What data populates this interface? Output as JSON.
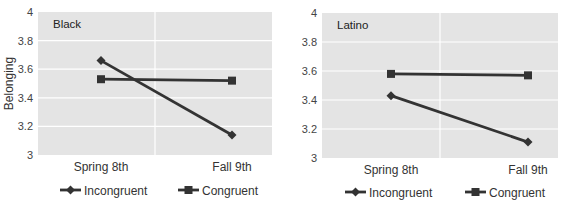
{
  "chart_data": [
    {
      "type": "line",
      "title": "Black",
      "xlabel": "",
      "ylabel": "Belonging",
      "categories": [
        "Spring 8th",
        "Fall 9th"
      ],
      "ylim": [
        3,
        4
      ],
      "yticks": [
        "3",
        "3.2",
        "3.4",
        "3.6",
        "3.8",
        "4"
      ],
      "grid": true,
      "legend_position": "bottom",
      "series": [
        {
          "name": "Incongruent",
          "marker": "diamond",
          "values": [
            3.66,
            3.14
          ]
        },
        {
          "name": "Congruent",
          "marker": "square",
          "values": [
            3.53,
            3.52
          ]
        }
      ]
    },
    {
      "type": "line",
      "title": "Latino",
      "xlabel": "",
      "ylabel": "",
      "categories": [
        "Spring 8th",
        "Fall 9th"
      ],
      "ylim": [
        3,
        4
      ],
      "yticks": [
        "3",
        "3.2",
        "3.4",
        "3.6",
        "3.8",
        "4"
      ],
      "grid": true,
      "legend_position": "bottom",
      "series": [
        {
          "name": "Incongruent",
          "marker": "diamond",
          "values": [
            3.43,
            3.11
          ]
        },
        {
          "name": "Congruent",
          "marker": "square",
          "values": [
            3.58,
            3.57
          ]
        }
      ]
    }
  ],
  "colors": {
    "plot_bg": "#e4e4e4",
    "grid": "#ffffff",
    "line": "#333333"
  }
}
